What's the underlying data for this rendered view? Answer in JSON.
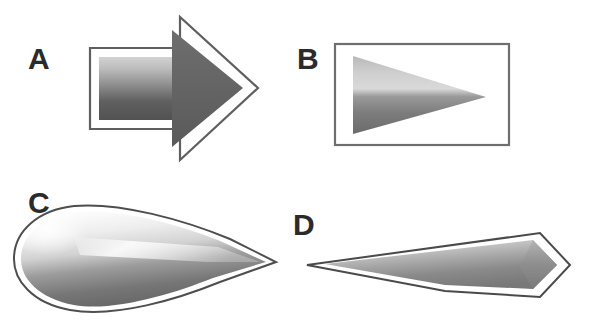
{
  "figure": {
    "background_color": "#ffffff",
    "panel_count": 4,
    "label_color": "#2b2b2b"
  },
  "panels": [
    {
      "id": "a",
      "label": "A",
      "shape_name": "block-arrow-right",
      "description": "Outlined right-pointing block arrow with vertical gradient fill",
      "outline_color": "#5a5a5a",
      "outline_fill": "#ffffff",
      "gradient_top": "#c9c9c9",
      "gradient_bottom": "#555555"
    },
    {
      "id": "b",
      "label": "B",
      "shape_name": "triangle-in-rectangle",
      "description": "Right-pointing triangle inside an outlined rectangle, gradient fill",
      "outline_color": "#6e6e6e",
      "outline_fill": "#ffffff",
      "gradient_top": "#cfcfcf",
      "gradient_bottom": "#6a6a6a"
    },
    {
      "id": "c",
      "label": "C",
      "shape_name": "teardrop-right",
      "description": "Teardrop with rounded left lobe and sharp right point, glossy gradient",
      "outline_color": "#4e4e4e",
      "outline_fill": "#ffffff",
      "gradient_top": "#f2f2f2",
      "gradient_bottom": "#6b6b6b"
    },
    {
      "id": "d",
      "label": "D",
      "shape_name": "kite-arrowhead-left",
      "description": "Elongated kite pointing left with pentagon outline and gradient fill",
      "outline_color": "#4a4a4a",
      "outline_fill": "#ffffff",
      "gradient_top": "#d8d8d8",
      "gradient_bottom": "#7a7a7a"
    }
  ]
}
